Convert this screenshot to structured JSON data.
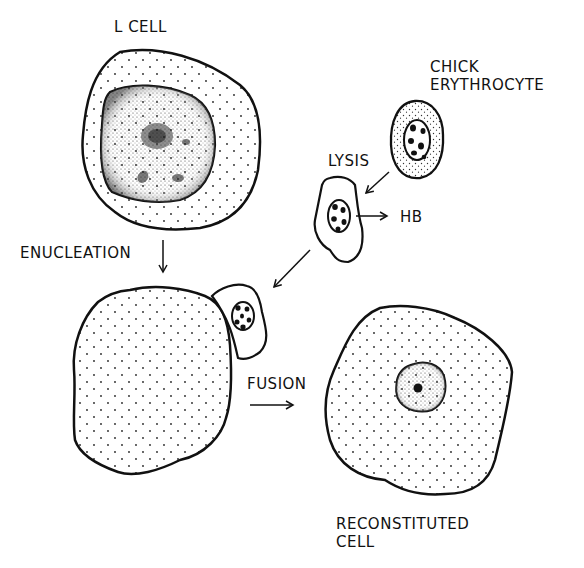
{
  "diagram": {
    "type": "biology-process-schematic",
    "labels": {
      "l_cell": "L CELL",
      "chick_line1": "CHICK",
      "chick_line2": "ERYTHROCYTE",
      "lysis": "LYSIS",
      "hb": "HB",
      "enucleation": "ENUCLEATION",
      "fusion": "FUSION",
      "reconstituted_line1": "RECONSTITUTED",
      "reconstituted_line2": "CELL"
    },
    "nodes": [
      {
        "id": "l-cell",
        "label": "L CELL",
        "description": "cell with large stippled nucleus"
      },
      {
        "id": "chick-erythrocyte",
        "label": "CHICK ERYTHROCYTE",
        "description": "oval cell with dark-spotted nucleus"
      },
      {
        "id": "lysed-erythrocyte",
        "label": "LYSIS",
        "description": "irregular ghost cell with nucleus"
      },
      {
        "id": "hemoglobin",
        "label": "HB"
      },
      {
        "id": "enucleated-l-cell",
        "label": "",
        "description": "L cell cytoplast without nucleus, fused with erythrocyte ghost"
      },
      {
        "id": "reconstituted-cell",
        "label": "RECONSTITUTED CELL",
        "description": "cell with small nucleus and nucleolus"
      }
    ],
    "edges": [
      {
        "from": "chick-erythrocyte",
        "to": "lysed-erythrocyte",
        "label": "LYSIS"
      },
      {
        "from": "lysed-erythrocyte",
        "to": "hemoglobin",
        "label": ""
      },
      {
        "from": "l-cell",
        "to": "enucleated-l-cell",
        "label": "ENUCLEATION"
      },
      {
        "from": "lysed-erythrocyte",
        "to": "enucleated-l-cell",
        "label": ""
      },
      {
        "from": "enucleated-l-cell",
        "to": "reconstituted-cell",
        "label": "FUSION"
      }
    ],
    "colors": {
      "ink": "#111111",
      "background": "#ffffff"
    }
  }
}
